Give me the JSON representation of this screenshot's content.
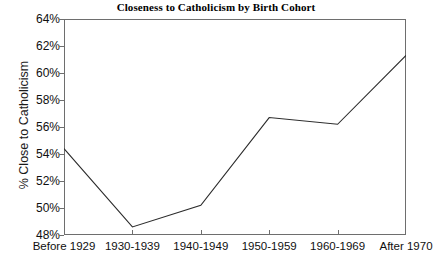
{
  "chart_data": {
    "type": "line",
    "title": "Closeness to Catholicism by Birth Cohort",
    "xlabel": "",
    "ylabel": "% Close to Catholicism",
    "categories": [
      "Before 1929",
      "1930-1939",
      "1940-1949",
      "1950-1959",
      "1960-1969",
      "After 1970"
    ],
    "values": [
      54.4,
      48.6,
      50.2,
      56.7,
      56.2,
      61.3
    ],
    "series": [
      {
        "name": "% Close to Catholicism",
        "values": [
          54.4,
          48.6,
          50.2,
          56.7,
          56.2,
          61.3
        ]
      }
    ],
    "ylim": [
      48,
      64
    ],
    "ytick_labels": [
      "64%",
      "62%",
      "60%",
      "58%",
      "56%",
      "54%",
      "52%",
      "50%",
      "48%"
    ],
    "ytick_values": [
      64,
      62,
      60,
      58,
      56,
      54,
      52,
      50,
      48
    ],
    "grid": false,
    "legend": false,
    "legend_position": "none",
    "line_color": "#2b2b2b",
    "frame_color": "#6e6e6e",
    "background_color": "#ffffff",
    "markers": false
  }
}
